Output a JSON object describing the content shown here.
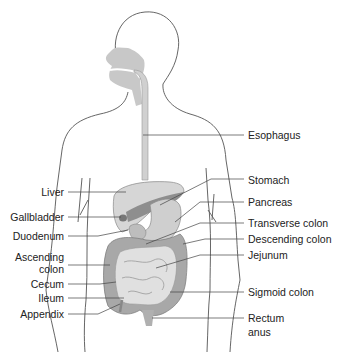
{
  "diagram": {
    "labels_left": [
      {
        "id": "liver",
        "text": "Liver"
      },
      {
        "id": "gallbladder",
        "text": "Gallbladder"
      },
      {
        "id": "duodenum",
        "text": "Duodenum"
      },
      {
        "id": "ascending-colon-1",
        "text": "Ascending"
      },
      {
        "id": "ascending-colon-2",
        "text": "colon"
      },
      {
        "id": "cecum",
        "text": "Cecum"
      },
      {
        "id": "ileum",
        "text": "Ileum"
      },
      {
        "id": "appendix",
        "text": "Appendix"
      }
    ],
    "labels_right": [
      {
        "id": "esophagus",
        "text": "Esophagus"
      },
      {
        "id": "stomach",
        "text": "Stomach"
      },
      {
        "id": "pancreas",
        "text": "Pancreas"
      },
      {
        "id": "transverse-colon",
        "text": "Transverse colon"
      },
      {
        "id": "descending-colon",
        "text": "Descending colon"
      },
      {
        "id": "jejunum",
        "text": "Jejunum"
      },
      {
        "id": "sigmoid-colon",
        "text": "Sigmoid colon"
      },
      {
        "id": "rectum-1",
        "text": "Rectum"
      },
      {
        "id": "rectum-2",
        "text": "anus"
      }
    ],
    "colors": {
      "outline": "#555555",
      "organ_light": "#d9d9d9",
      "organ_mid": "#b5b5b5",
      "organ_dark": "#8a8a8a",
      "leader": "#444444"
    }
  }
}
